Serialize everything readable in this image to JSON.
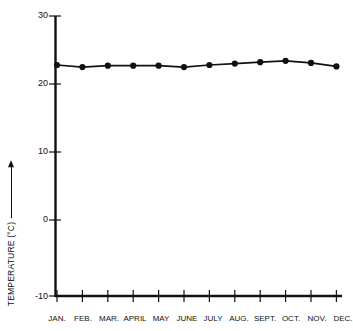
{
  "chart_data": {
    "type": "line",
    "title": "",
    "subtitle": "",
    "xlabel": "",
    "ylabel": "TEMPERATURE (°C)",
    "ylabel_has_arrow": true,
    "categories": [
      "JAN.",
      "FEB.",
      "MAR.",
      "APRIL",
      "MAY",
      "JUNE",
      "JULY",
      "AUG.",
      "SEPT.",
      "OCT.",
      "NOV.",
      "DEC."
    ],
    "values": [
      23.0,
      22.7,
      22.9,
      22.9,
      22.9,
      22.7,
      23.0,
      23.2,
      23.4,
      23.6,
      23.3,
      22.8
    ],
    "series": [
      {
        "name": "Monthly mean temperature",
        "values": [
          23.0,
          22.7,
          22.9,
          22.9,
          22.9,
          22.7,
          23.0,
          23.2,
          23.4,
          23.6,
          23.3,
          22.8
        ]
      }
    ],
    "ylim": [
      -10,
      30
    ],
    "yticks": [
      -10,
      0,
      10,
      20,
      30
    ],
    "ytick_labels": [
      "-10",
      "0",
      "10",
      "20",
      "30"
    ],
    "grid": false,
    "legend": false,
    "legend_position": "none",
    "marker": "filled-circle",
    "line_color": "#111111",
    "marker_color": "#111111",
    "axis_color": "#111111",
    "background_color": "#ffffff"
  },
  "axes": {
    "y_label_text": "TEMPERATURE (°C)",
    "y_tick_0": "30",
    "y_tick_1": "20",
    "y_tick_2": "10",
    "y_tick_3": "0",
    "y_tick_4": "-10"
  },
  "x_labels": {
    "m0": "JAN.",
    "m1": "FEB.",
    "m2": "MAR.",
    "m3": "APRIL",
    "m4": "MAY",
    "m5": "JUNE",
    "m6": "JULY",
    "m7": "AUG.",
    "m8": "SEPT.",
    "m9": "OCT.",
    "m10": "NOV.",
    "m11": "DEC."
  }
}
